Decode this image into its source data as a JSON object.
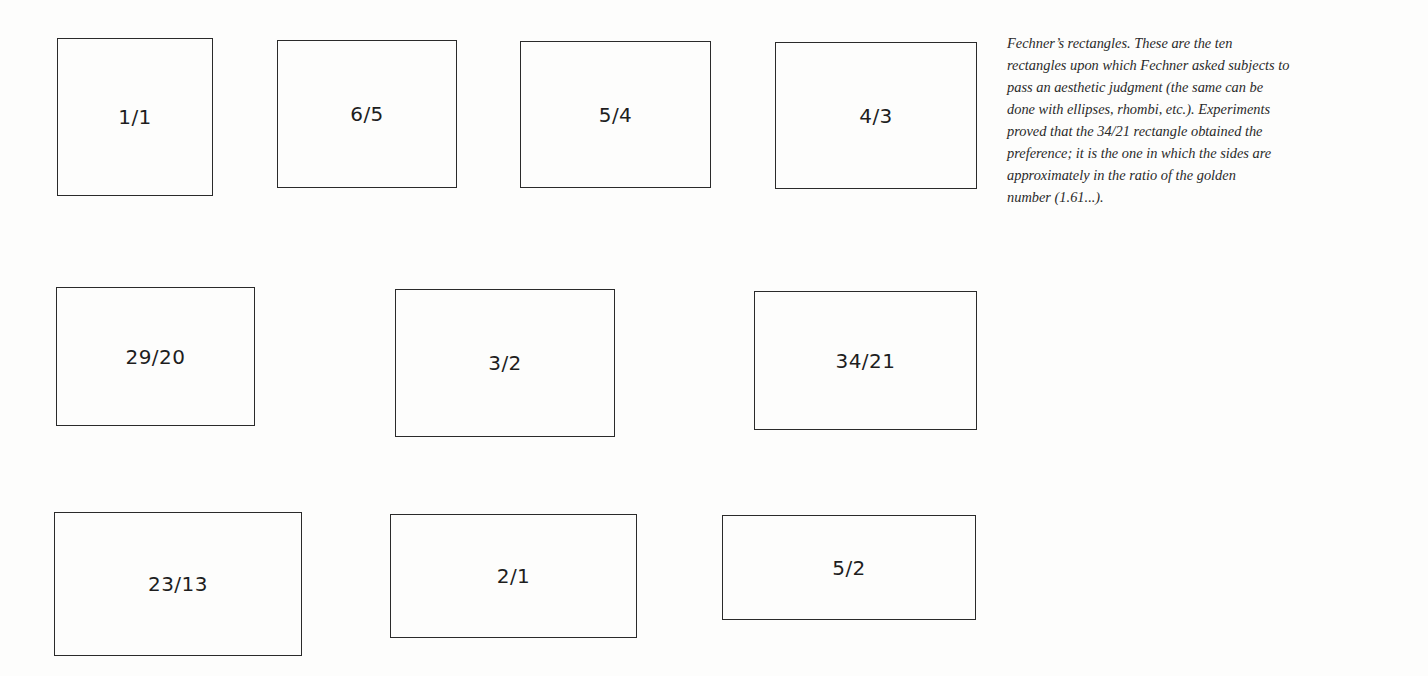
{
  "figure": {
    "rectangles": [
      {
        "label": "1/1",
        "x": 57,
        "y": 38,
        "w": 156,
        "h": 158
      },
      {
        "label": "6/5",
        "x": 277,
        "y": 40,
        "w": 180,
        "h": 148
      },
      {
        "label": "5/4",
        "x": 520,
        "y": 41,
        "w": 191,
        "h": 147
      },
      {
        "label": "4/3",
        "x": 775,
        "y": 42,
        "w": 202,
        "h": 147
      },
      {
        "label": "29/20",
        "x": 56,
        "y": 287,
        "w": 199,
        "h": 139
      },
      {
        "label": "3/2",
        "x": 395,
        "y": 289,
        "w": 220,
        "h": 148
      },
      {
        "label": "34/21",
        "x": 754,
        "y": 291,
        "w": 223,
        "h": 139
      },
      {
        "label": "23/13",
        "x": 54,
        "y": 512,
        "w": 248,
        "h": 144
      },
      {
        "label": "2/1",
        "x": 390,
        "y": 514,
        "w": 247,
        "h": 124
      },
      {
        "label": "5/2",
        "x": 722,
        "y": 515,
        "w": 254,
        "h": 105
      }
    ]
  },
  "caption": {
    "lines": [
      "Fechner’s rectangles.  These are the ten",
      "rectangles upon which Fechner asked subjects to",
      "pass an aesthetic judgment (the same can be",
      "done with ellipses, rhombi, etc.). Experiments",
      "proved that the 34/21 rectangle obtained the",
      "preference; it is the one in which the sides are",
      "approximately in the ratio of the golden",
      "number (1.61...)."
    ]
  }
}
